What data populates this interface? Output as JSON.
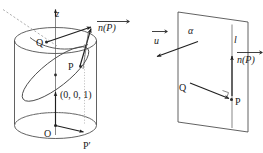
{
  "figure": {
    "panels": [
      {
        "id": "left",
        "name": "cylinder-panel",
        "description": "Right circular cylinder with z-axis, tilted ellipse curve, points Q, P, P-prime, O and normal vector n(P)",
        "labels": {
          "z_axis": "z",
          "point_q": "Q",
          "point_p": "P",
          "point_p_prime": "P′",
          "origin": "O",
          "unit_point": "(0, 0, 1)",
          "normal_vector": "n(P)"
        }
      },
      {
        "id": "right",
        "name": "plane-panel",
        "description": "Plane alpha containing point Q, with line l through P and normal vector n(P), plus direction vector u",
        "labels": {
          "plane": "α",
          "line": "l",
          "direction_vector": "u",
          "point_q": "Q",
          "point_p": "P",
          "normal_vector": "n(P)"
        }
      }
    ],
    "colors": {
      "background": "#ffffff",
      "outline": "#3a3a3a",
      "vector": "#1f1f1f",
      "dashed": "#9a9a9a",
      "text": "#1a1a1a"
    }
  }
}
